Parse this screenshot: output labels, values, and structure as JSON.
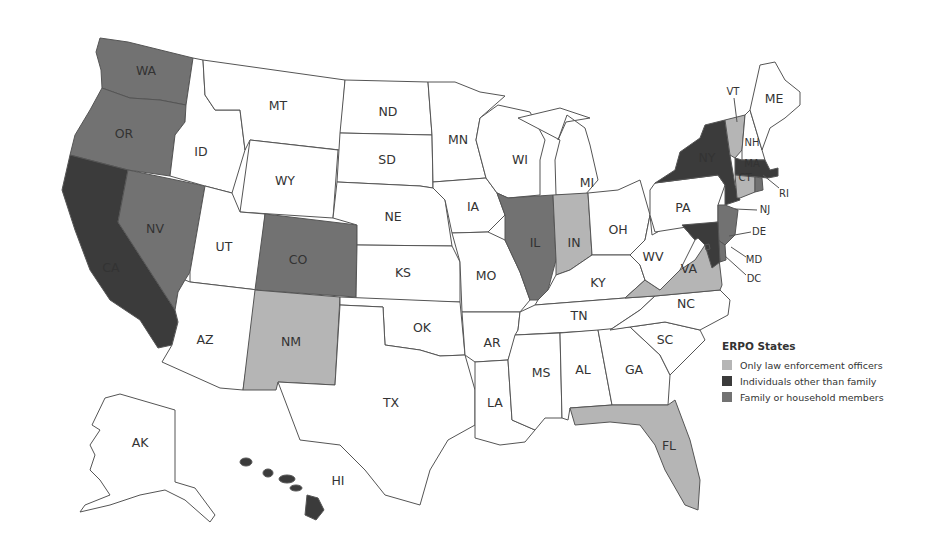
{
  "legend": {
    "title": "ERPO States",
    "items": [
      {
        "key": "law",
        "label": "Only law enforcement officers",
        "color": "#b5b5b5"
      },
      {
        "key": "others",
        "label": "Individuals other than family",
        "color": "#3b3b3b"
      },
      {
        "key": "family",
        "label": "Family or household members",
        "color": "#727272"
      }
    ]
  },
  "colors": {
    "none": "#ffffff",
    "law": "#b5b5b5",
    "others": "#3b3b3b",
    "family": "#727272",
    "stroke": "#555555"
  },
  "states": {
    "WA": {
      "label": "WA",
      "category": "family"
    },
    "OR": {
      "label": "OR",
      "category": "family"
    },
    "CA": {
      "label": "CA",
      "category": "others"
    },
    "NV": {
      "label": "NV",
      "category": "family"
    },
    "ID": {
      "label": "ID",
      "category": "none"
    },
    "MT": {
      "label": "MT",
      "category": "none"
    },
    "WY": {
      "label": "WY",
      "category": "none"
    },
    "UT": {
      "label": "UT",
      "category": "none"
    },
    "CO": {
      "label": "CO",
      "category": "family"
    },
    "AZ": {
      "label": "AZ",
      "category": "none"
    },
    "NM": {
      "label": "NM",
      "category": "law"
    },
    "ND": {
      "label": "ND",
      "category": "none"
    },
    "SD": {
      "label": "SD",
      "category": "none"
    },
    "NE": {
      "label": "NE",
      "category": "none"
    },
    "KS": {
      "label": "KS",
      "category": "none"
    },
    "OK": {
      "label": "OK",
      "category": "none"
    },
    "TX": {
      "label": "TX",
      "category": "none"
    },
    "MN": {
      "label": "MN",
      "category": "none"
    },
    "IA": {
      "label": "IA",
      "category": "none"
    },
    "MO": {
      "label": "MO",
      "category": "none"
    },
    "AR": {
      "label": "AR",
      "category": "none"
    },
    "LA": {
      "label": "LA",
      "category": "none"
    },
    "WI": {
      "label": "WI",
      "category": "none"
    },
    "IL": {
      "label": "IL",
      "category": "family"
    },
    "MI": {
      "label": "MI",
      "category": "none"
    },
    "IN": {
      "label": "IN",
      "category": "law"
    },
    "OH": {
      "label": "OH",
      "category": "none"
    },
    "KY": {
      "label": "KY",
      "category": "none"
    },
    "TN": {
      "label": "TN",
      "category": "none"
    },
    "MS": {
      "label": "MS",
      "category": "none"
    },
    "AL": {
      "label": "AL",
      "category": "none"
    },
    "GA": {
      "label": "GA",
      "category": "none"
    },
    "FL": {
      "label": "FL",
      "category": "law"
    },
    "SC": {
      "label": "SC",
      "category": "none"
    },
    "NC": {
      "label": "NC",
      "category": "none"
    },
    "VA": {
      "label": "VA",
      "category": "law"
    },
    "WV": {
      "label": "WV",
      "category": "none"
    },
    "PA": {
      "label": "PA",
      "category": "none"
    },
    "NY": {
      "label": "NY",
      "category": "others"
    },
    "NJ": {
      "label": "NJ",
      "category": "family"
    },
    "DE": {
      "label": "DE",
      "category": "family"
    },
    "MD": {
      "label": "MD",
      "category": "others"
    },
    "DC": {
      "label": "DC",
      "category": "others"
    },
    "VT": {
      "label": "VT",
      "category": "law"
    },
    "NH": {
      "label": "NH",
      "category": "none"
    },
    "ME": {
      "label": "ME",
      "category": "none"
    },
    "MA": {
      "label": "MA",
      "category": "others"
    },
    "CT": {
      "label": "CT",
      "category": "law"
    },
    "RI": {
      "label": "RI",
      "category": "family"
    },
    "AK": {
      "label": "AK",
      "category": "none"
    },
    "HI": {
      "label": "HI",
      "category": "others"
    }
  }
}
